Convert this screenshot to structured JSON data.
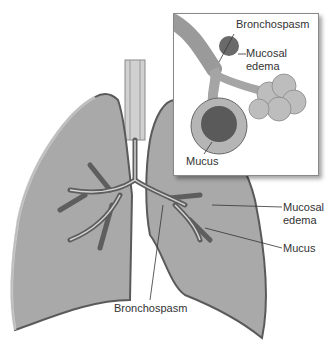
{
  "figure": {
    "type": "medical-illustration",
    "colors": {
      "lung_fill": "#a9a9a9",
      "lung_edge": "#5a5a5a",
      "airway": "#6e6e6e",
      "background": "#ffffff"
    }
  },
  "inset": {
    "labels": [
      {
        "text": "Bronchospasm"
      },
      {
        "text": "Mucosal"
      },
      {
        "text": "edema"
      },
      {
        "text": "Mucus"
      }
    ]
  },
  "main": {
    "labels": [
      {
        "text": "Mucosal"
      },
      {
        "text": "edema"
      },
      {
        "text": "Mucus"
      },
      {
        "text": "Bronchospasm"
      }
    ]
  }
}
